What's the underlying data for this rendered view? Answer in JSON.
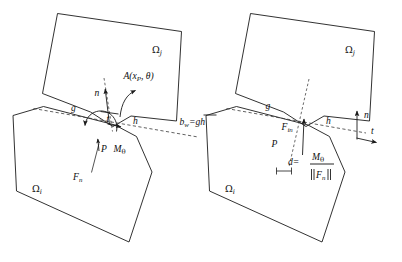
{
  "figure": {
    "type": "technical-diagram",
    "background_color": "#ffffff",
    "line_color": "#1b1b1b",
    "dashed_color": "#3a3a3a",
    "width": 402,
    "height": 262
  },
  "panels": [
    {
      "id": "left",
      "name": "left-panel",
      "domains": [
        {
          "name": "upper-domain",
          "label": "Ω",
          "subscript": "j"
        },
        {
          "name": "lower-domain",
          "label": "Ω",
          "subscript": "i"
        }
      ],
      "points": [
        {
          "name": "contact-point-g",
          "label": "g"
        },
        {
          "name": "contact-point-h",
          "label": "h"
        },
        {
          "name": "contact-point-P",
          "label": "P"
        }
      ],
      "vectors": [
        {
          "name": "normal-vector",
          "label": "n"
        },
        {
          "name": "tangent-vector",
          "label": "t"
        },
        {
          "name": "normal-force",
          "label": "F",
          "subscript": "n"
        }
      ],
      "annotations": [
        {
          "name": "rotation-operator",
          "label": "A(x",
          "subscript": "P",
          "tail": ", θ)"
        },
        {
          "name": "moment-label",
          "label": "M",
          "subscript": "θ"
        }
      ]
    },
    {
      "id": "right",
      "name": "right-panel",
      "domains": [
        {
          "name": "upper-domain",
          "label": "Ω",
          "subscript": "j"
        },
        {
          "name": "lower-domain",
          "label": "Ω",
          "subscript": "i"
        }
      ],
      "points": [
        {
          "name": "contact-point-g",
          "label": "g"
        },
        {
          "name": "contact-point-h",
          "label": "h"
        },
        {
          "name": "contact-point-P",
          "label": "P"
        }
      ],
      "vectors": [
        {
          "name": "normal-vector",
          "label": "n"
        },
        {
          "name": "tangent-vector",
          "label": "t"
        },
        {
          "name": "interface-normal-force",
          "label": "F",
          "subscript": "in"
        }
      ],
      "annotations": [
        {
          "name": "offset-distance",
          "label": "d"
        },
        {
          "name": "equals-sign",
          "label": "="
        },
        {
          "name": "moment-numerator",
          "label": "M",
          "subscript": "θ"
        },
        {
          "name": "force-norm-denominator",
          "label": "F",
          "subscript": "n"
        }
      ]
    }
  ],
  "center_equation": {
    "name": "contact-width-equation",
    "lhs": "b",
    "lhs_subscript": "w",
    "operator": "=",
    "rhs": "gh",
    "rhs_has_overline": true
  },
  "labels": {
    "omega": "Ω",
    "sub_i": "i",
    "sub_j": "j",
    "theta": "θ",
    "g": "g",
    "h": "h",
    "P": "P",
    "n": "n",
    "t": "t",
    "d": "d",
    "equals": "=",
    "F": "F",
    "sub_n": "n",
    "sub_in": "in",
    "M": "M",
    "A_open": "A(x",
    "A_sub": "P",
    "A_close": ", θ)",
    "b": "b",
    "sub_w": "w",
    "gh": "gh"
  }
}
